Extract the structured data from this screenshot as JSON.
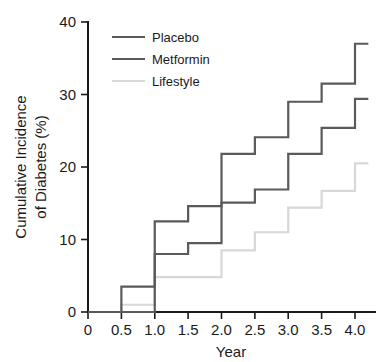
{
  "chart_data": {
    "type": "line",
    "subtype": "step-function cumulative incidence (Kaplan-Meier style)",
    "title": "",
    "xlabel": "Year",
    "ylabel": "Cumulative Incidence of Diabetes (%)",
    "ylabel_lines": [
      "Cumulative Incidence",
      "of Diabetes (%)"
    ],
    "xlim": [
      0,
      4.3
    ],
    "ylim": [
      0,
      40
    ],
    "xticks": [
      0,
      0.5,
      1.0,
      1.5,
      2.0,
      2.5,
      3.0,
      3.5,
      4.0
    ],
    "xticklabels": [
      "0",
      "0.5",
      "1.0",
      "1.5",
      "2.0",
      "2.5",
      "3.0",
      "3.5",
      "4.0"
    ],
    "yticks": [
      0,
      10,
      20,
      30,
      40
    ],
    "yticklabels": [
      "0",
      "10",
      "20",
      "30",
      "40"
    ],
    "grid": false,
    "legend_position": "upper left",
    "x": [
      0,
      0.5,
      1.0,
      1.5,
      2.0,
      2.5,
      3.0,
      3.5,
      4.0,
      4.2
    ],
    "series": [
      {
        "name": "Placebo",
        "color": "#5a5a5a",
        "values": [
          0,
          3.5,
          12.5,
          14.6,
          21.8,
          24.1,
          29.0,
          31.5,
          37.0,
          37.0
        ]
      },
      {
        "name": "Metformin",
        "color": "#5a5a5a",
        "values": [
          0,
          0,
          8.0,
          9.5,
          15.1,
          16.9,
          21.8,
          25.4,
          29.4,
          29.4
        ]
      },
      {
        "name": "Lifestyle",
        "color": "#d8d8d8",
        "values": [
          0,
          1.0,
          4.8,
          4.8,
          8.5,
          11.0,
          14.4,
          16.7,
          20.5,
          20.5
        ]
      }
    ]
  },
  "legend": {
    "items": [
      {
        "label": "Placebo",
        "color": "#5a5a5a"
      },
      {
        "label": "Metformin",
        "color": "#5a5a5a"
      },
      {
        "label": "Lifestyle",
        "color": "#d8d8d8"
      }
    ]
  },
  "axes": {
    "x_title": "Year",
    "y_title_line1": "Cumulative Incidence",
    "y_title_line2": "of Diabetes (%)",
    "x_tick_labels": [
      "0",
      "0.5",
      "1.0",
      "1.5",
      "2.0",
      "2.5",
      "3.0",
      "3.5",
      "4.0"
    ],
    "y_tick_labels": [
      "0",
      "10",
      "20",
      "30",
      "40"
    ]
  },
  "colors": {
    "placebo": "#5a5a5a",
    "metformin": "#5a5a5a",
    "lifestyle": "#d8d8d8",
    "axis": "#1a1a1a",
    "background": "#ffffff"
  }
}
